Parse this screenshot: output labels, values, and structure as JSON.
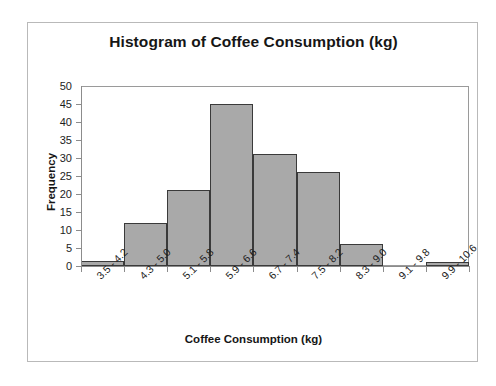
{
  "chart_data": {
    "type": "bar",
    "title": "Histogram of Coffee Consumption (kg)",
    "xlabel": "Coffee Consumption (kg)",
    "ylabel": "Frequency",
    "categories": [
      "3.5 - 4.2",
      "4.3 - 5.0",
      "5.1 - 5.8",
      "5.9 - 6.6",
      "6.7 - 7.4",
      "7.5 - 8.2",
      "8.3 - 9.0",
      "9.1 - 9.8",
      "9.9 - 10.6"
    ],
    "values": [
      1.5,
      12,
      21,
      45,
      31,
      26,
      6,
      0,
      1
    ],
    "ylim": [
      0,
      50
    ],
    "ytick_values": [
      0,
      5,
      10,
      15,
      20,
      25,
      30,
      35,
      40,
      45,
      50
    ],
    "ytick_labels": [
      "0",
      "5",
      "10",
      "15",
      "20",
      "25",
      "30",
      "35",
      "40",
      "45",
      "50"
    ],
    "grid": false,
    "legend": false,
    "bar_fill_color": "#a9a9a9",
    "bar_edge_color": "#3a3a3a",
    "axis_color": "#8c8c8c",
    "text_color": "#161616",
    "xtick_rotation": -45
  }
}
